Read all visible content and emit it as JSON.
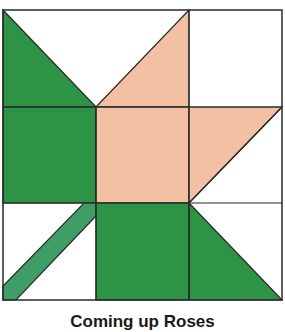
{
  "block": {
    "name": "Coming up Roses",
    "grid": "3x3",
    "colors": {
      "leaf_green": "#2e9445",
      "stem_green": "#3f9e65",
      "rose_peach": "#f4c0a3",
      "background": "#ffffff",
      "outline": "#2a2a2a"
    }
  },
  "caption": "Coming up Roses"
}
